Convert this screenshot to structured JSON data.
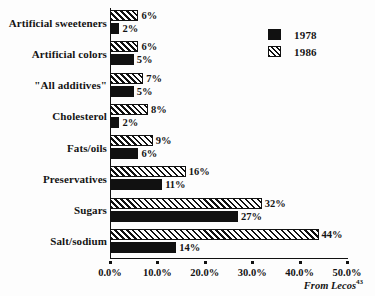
{
  "chart_data": {
    "type": "bar",
    "orientation": "horizontal",
    "title": "",
    "xlabel": "",
    "ylabel": "",
    "xlim": [
      0,
      50
    ],
    "xticks": [
      "0.0%",
      "10.0%",
      "20.0%",
      "30.0%",
      "40.0%",
      "50.0%"
    ],
    "xtick_values": [
      0,
      10,
      20,
      30,
      40,
      50
    ],
    "grid": false,
    "legend_position": "top-right",
    "categories": [
      "Artificial sweeteners",
      "Artificial colors",
      "\"All additives\"",
      "Cholesterol",
      "Fats/oils",
      "Preservatives",
      "Sugars",
      "Salt/sodium"
    ],
    "series": [
      {
        "name": "1978",
        "values": [
          2,
          5,
          5,
          2,
          6,
          11,
          27,
          14
        ],
        "labels": [
          "2%",
          "5%",
          "5%",
          "2%",
          "6%",
          "11%",
          "27%",
          "14%"
        ],
        "color": "#111111",
        "pattern": "solid"
      },
      {
        "name": "1986",
        "values": [
          6,
          6,
          7,
          8,
          9,
          16,
          32,
          44
        ],
        "labels": [
          "6%",
          "6%",
          "7%",
          "8%",
          "9%",
          "16%",
          "32%",
          "44%"
        ],
        "color": "#111111",
        "pattern": "hatched"
      }
    ]
  },
  "legend": {
    "items": [
      {
        "label": "1978",
        "pattern": "solid"
      },
      {
        "label": "1986",
        "pattern": "hatched"
      }
    ]
  },
  "source": {
    "text": "From Lecos",
    "reference": "43"
  }
}
